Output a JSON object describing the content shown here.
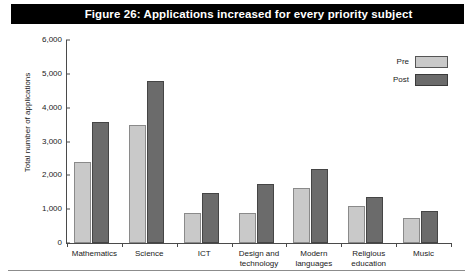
{
  "figure": {
    "title": "Figure 26: Applications increased for every priority subject",
    "title_bg": "#000000",
    "title_fg": "#ffffff"
  },
  "legend": {
    "position": "top-right",
    "entries": [
      {
        "label": "Pre",
        "color": "#c9c9c9"
      },
      {
        "label": "Post",
        "color": "#6b6b6b"
      }
    ]
  },
  "axes": {
    "ylabel": "Total number of applications",
    "xlabel": "",
    "yticks": [
      "0",
      "1,000",
      "2,000",
      "3,000",
      "4,000",
      "5,000",
      "6,000"
    ]
  },
  "chart_data": {
    "type": "bar",
    "title": "Figure 26: Applications increased for every priority subject",
    "xlabel": "",
    "ylabel": "Total number of applications",
    "ylim": [
      0,
      6000
    ],
    "ytick_values": [
      0,
      1000,
      2000,
      3000,
      4000,
      5000,
      6000
    ],
    "ytick_labels": [
      "0",
      "1,000",
      "2,000",
      "3,000",
      "4,000",
      "5,000",
      "6,000"
    ],
    "grid": false,
    "legend_position": "top-right",
    "categories": [
      "Mathematics",
      "Science",
      "ICT",
      "Design and technology",
      "Modern languages",
      "Religious education",
      "Music"
    ],
    "category_lines": [
      [
        "Mathematics"
      ],
      [
        "Science"
      ],
      [
        "ICT"
      ],
      [
        "Design and",
        "technology"
      ],
      [
        "Modern",
        "languages"
      ],
      [
        "Religious",
        "education"
      ],
      [
        "Music"
      ]
    ],
    "series": [
      {
        "name": "Pre",
        "color": "#c9c9c9",
        "values": [
          2400,
          3500,
          900,
          900,
          1630,
          1100,
          750
        ]
      },
      {
        "name": "Post",
        "color": "#6b6b6b",
        "values": [
          3580,
          4800,
          1480,
          1730,
          2180,
          1350,
          950
        ]
      }
    ]
  }
}
